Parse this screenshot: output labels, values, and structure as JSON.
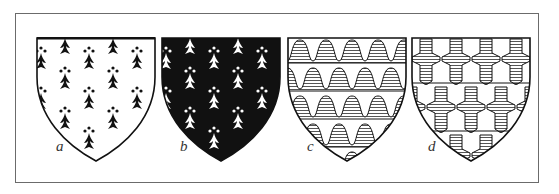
{
  "figure": {
    "panels": [
      {
        "id": "a",
        "label": "a",
        "name": "ermine",
        "field": "#ffffff",
        "charge": "#111111",
        "pattern": "ermine-spots"
      },
      {
        "id": "b",
        "label": "b",
        "name": "ermines",
        "field": "#111111",
        "charge": "#ffffff",
        "pattern": "ermine-spots"
      },
      {
        "id": "c",
        "label": "c",
        "name": "vair",
        "field": "#ffffff",
        "charge": "#777777",
        "pattern": "bell-rows-hatched"
      },
      {
        "id": "d",
        "label": "d",
        "name": "potent",
        "field": "#ffffff",
        "charge": "#777777",
        "pattern": "potent-hatched"
      }
    ]
  },
  "colors": {
    "frame": "#6b6b6b",
    "ink": "#111111",
    "hatch": "#555555",
    "background": "#ffffff"
  }
}
